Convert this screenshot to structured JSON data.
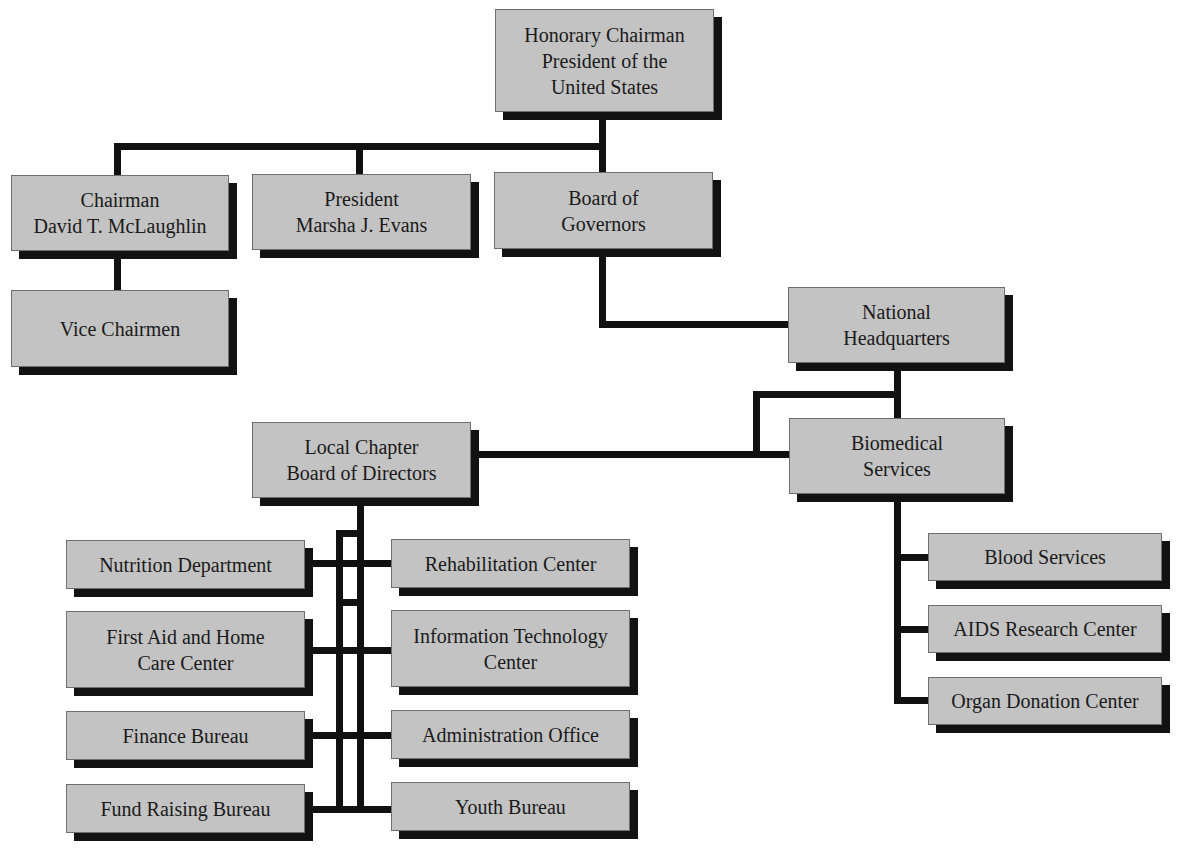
{
  "chart_title": "",
  "colors": {
    "box_fill": "#c3c3c3",
    "box_shadow": "#121212",
    "connector": "#111111",
    "background": "#ffffff"
  },
  "nodes": {
    "honorary_chairman": {
      "lines": [
        "Honorary Chairman",
        "President of the",
        "United States"
      ]
    },
    "chairman": {
      "lines": [
        "Chairman",
        "David T. McLaughlin"
      ]
    },
    "president": {
      "lines": [
        "President",
        "Marsha J. Evans"
      ]
    },
    "board_of_governors": {
      "lines": [
        "Board of",
        "Governors"
      ]
    },
    "vice_chairmen": {
      "lines": [
        "Vice Chairmen"
      ]
    },
    "national_headquarters": {
      "lines": [
        "National",
        "Headquarters"
      ]
    },
    "biomedical_services": {
      "lines": [
        "Biomedical",
        "Services"
      ]
    },
    "local_chapter": {
      "lines": [
        "Local Chapter",
        "Board of Directors"
      ]
    },
    "blood_services": {
      "lines": [
        "Blood Services"
      ]
    },
    "aids_research_center": {
      "lines": [
        "AIDS Research Center"
      ]
    },
    "organ_donation_center": {
      "lines": [
        "Organ Donation Center"
      ]
    },
    "nutrition_department": {
      "lines": [
        "Nutrition Department"
      ]
    },
    "rehabilitation_center": {
      "lines": [
        "Rehabilitation Center"
      ]
    },
    "first_aid_home_care": {
      "lines": [
        "First Aid and Home",
        "Care Center"
      ]
    },
    "information_technology": {
      "lines": [
        "Information Technology",
        "Center"
      ]
    },
    "finance_bureau": {
      "lines": [
        "Finance Bureau"
      ]
    },
    "administration_office": {
      "lines": [
        "Administration Office"
      ]
    },
    "fund_raising_bureau": {
      "lines": [
        "Fund Raising Bureau"
      ]
    },
    "youth_bureau": {
      "lines": [
        "Youth Bureau"
      ]
    }
  },
  "hierarchy": {
    "honorary_chairman": [
      "chairman",
      "president",
      "board_of_governors"
    ],
    "chairman": [
      "vice_chairmen"
    ],
    "board_of_governors": [
      "national_headquarters"
    ],
    "national_headquarters": [
      "biomedical_services",
      "local_chapter"
    ],
    "biomedical_services": [
      "blood_services",
      "aids_research_center",
      "organ_donation_center"
    ],
    "local_chapter": [
      "nutrition_department",
      "rehabilitation_center",
      "first_aid_home_care",
      "information_technology",
      "finance_bureau",
      "administration_office",
      "fund_raising_bureau",
      "youth_bureau"
    ]
  }
}
